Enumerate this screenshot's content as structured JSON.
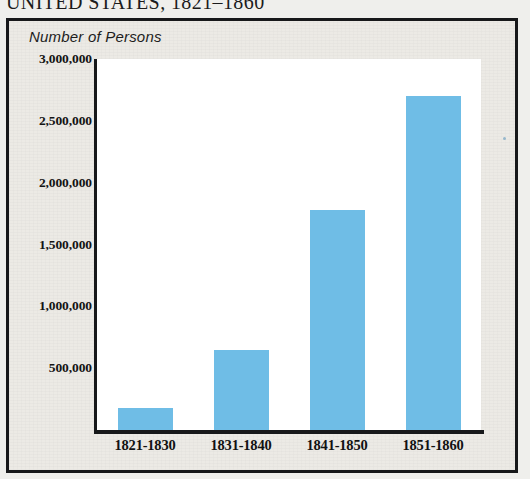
{
  "figure": {
    "title_fragment": "UNITED STATES, 1821–1860",
    "axis_caption": "Number of Persons"
  },
  "chart_data": {
    "type": "bar",
    "title": "UNITED STATES, 1821–1860",
    "xlabel": "",
    "ylabel": "Number of Persons",
    "categories": [
      "1821-1830",
      "1831-1840",
      "1841-1850",
      "1851-1860"
    ],
    "values": [
      180000,
      650000,
      1780000,
      2700000
    ],
    "ylim": [
      0,
      3000000
    ],
    "ytick_labels": [
      "3,000,000",
      "2,500,000",
      "2,000,000",
      "1,500,000",
      "1,000,000",
      "500,000"
    ],
    "ytick_values": [
      3000000,
      2500000,
      2000000,
      1500000,
      1000000,
      500000
    ],
    "grid": false,
    "legend": "none",
    "bar_color": "#6fbde6",
    "plot_background": "#ffffff",
    "panel_background": "#eceae5",
    "axis_color": "#17181a"
  }
}
